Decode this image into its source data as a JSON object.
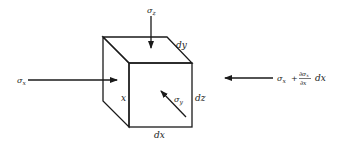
{
  "diagram": {
    "labels": {
      "sigma_z": "σ",
      "sigma_z_sub": "z",
      "sigma_x_left": "σ",
      "sigma_x_left_sub": "x",
      "sigma_y": "σ",
      "sigma_y_sub": "y",
      "dy": "dy",
      "dz": "dz",
      "dx": "dx",
      "x": "x",
      "sigma_x_right": "σ",
      "sigma_x_right_sub": "x",
      "plus": "+",
      "partial_num": "∂σ",
      "partial_num_sub": "x",
      "partial_den": "∂x",
      "dx_right": "dx"
    }
  }
}
